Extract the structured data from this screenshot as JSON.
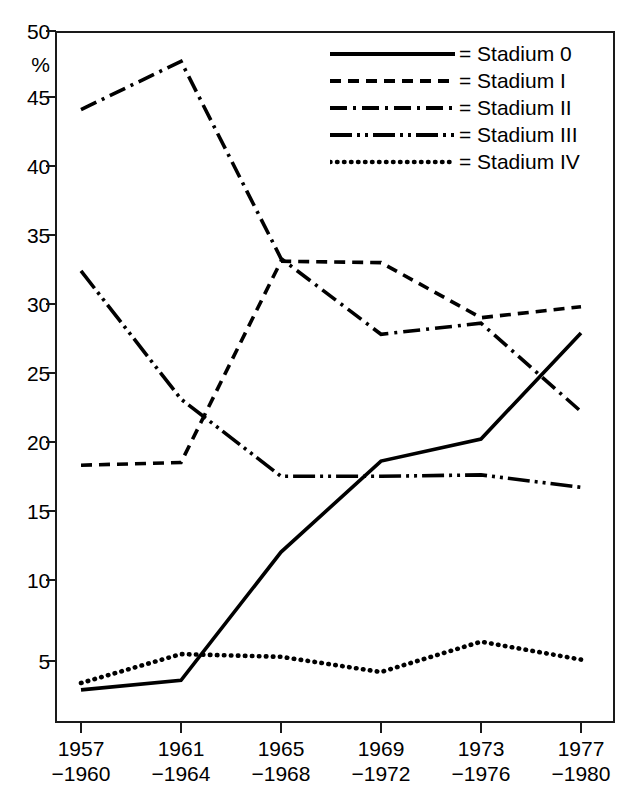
{
  "chart_data": {
    "type": "line",
    "title": "",
    "xlabel": "",
    "ylabel": "%",
    "ylim": [
      0,
      50
    ],
    "yticks": [
      50,
      45,
      40,
      35,
      30,
      25,
      20,
      15,
      10,
      5
    ],
    "grid": false,
    "legend_position": "top-right",
    "categories": [
      "1957–1960",
      "1961–1964",
      "1965–1968",
      "1969–1972",
      "1973–1976",
      "1977–1980"
    ],
    "category_lines": [
      {
        "start": "1957",
        "end": "−1960"
      },
      {
        "start": "1961",
        "end": "−1964"
      },
      {
        "start": "1965",
        "end": "−1968"
      },
      {
        "start": "1969",
        "end": "−1972"
      },
      {
        "start": "1973",
        "end": "−1976"
      },
      {
        "start": "1977",
        "end": "−1980"
      }
    ],
    "series": [
      {
        "name": "Stadium 0",
        "style": "solid",
        "legend_label": "= Stadium 0",
        "values": [
          2.2,
          2.9,
          12.2,
          18.8,
          20.4,
          28.1
        ]
      },
      {
        "name": "Stadium I",
        "style": "dashed",
        "legend_label": "= Stadium I",
        "values": [
          18.5,
          18.7,
          33.3,
          33.2,
          29.2,
          30.0
        ]
      },
      {
        "name": "Stadium II",
        "style": "dash-dot",
        "legend_label": "= Stadium II",
        "values": [
          44.3,
          47.8,
          33.5,
          28.0,
          28.8,
          22.4
        ]
      },
      {
        "name": "Stadium III",
        "style": "dash-dot-dot",
        "legend_label": "= Stadium III",
        "values": [
          32.6,
          23.3,
          17.7,
          17.7,
          17.8,
          16.9
        ]
      },
      {
        "name": "Stadium IV",
        "style": "dotted",
        "legend_label": "= Stadium IV",
        "values": [
          2.7,
          4.8,
          4.6,
          3.5,
          5.7,
          4.4
        ]
      }
    ]
  },
  "axis": {
    "y_unit": "%",
    "y_labels": [
      "50",
      "45",
      "40",
      "35",
      "30",
      "25",
      "20",
      "15",
      "10",
      "5"
    ]
  },
  "legend": {
    "items": [
      {
        "label": "= Stadium 0"
      },
      {
        "label": "= Stadium I"
      },
      {
        "label": "= Stadium II"
      },
      {
        "label": "= Stadium III"
      },
      {
        "label": "= Stadium IV"
      }
    ]
  },
  "caption": {
    "partial_text": ""
  }
}
